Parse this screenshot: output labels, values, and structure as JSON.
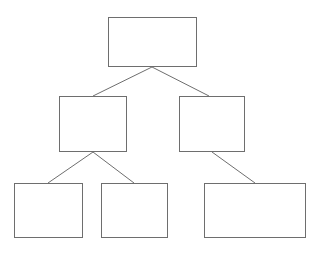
{
  "diagram": {
    "type": "tree",
    "canvas": {
      "width": 321,
      "height": 255,
      "background": "#ffffff"
    },
    "style": {
      "box_fill": "#ffffff",
      "box_border_color": "#6e6e6e",
      "box_border_width": 1,
      "connector_color": "#6e6e6e",
      "connector_width": 1
    },
    "levels": 3,
    "nodes": [
      {
        "id": "root",
        "label": "",
        "level": 0,
        "x": 108,
        "y": 17,
        "width": 89,
        "height": 50
      },
      {
        "id": "mid-left",
        "label": "",
        "level": 1,
        "x": 59,
        "y": 96,
        "width": 68,
        "height": 56
      },
      {
        "id": "mid-right",
        "label": "",
        "level": 1,
        "x": 179,
        "y": 96,
        "width": 66,
        "height": 56
      },
      {
        "id": "leaf-1",
        "label": "",
        "level": 2,
        "x": 14,
        "y": 183,
        "width": 69,
        "height": 55
      },
      {
        "id": "leaf-2",
        "label": "",
        "level": 2,
        "x": 101,
        "y": 183,
        "width": 67,
        "height": 55
      },
      {
        "id": "leaf-3",
        "label": "",
        "level": 2,
        "x": 204,
        "y": 183,
        "width": 102,
        "height": 55
      }
    ],
    "connectors": [
      {
        "id": "root-to-mid-left",
        "from": "root",
        "to": "mid-left",
        "x1": 152,
        "y1": 67,
        "x2": 93,
        "y2": 96
      },
      {
        "id": "root-to-mid-right",
        "from": "root",
        "to": "mid-right",
        "x1": 152,
        "y1": 67,
        "x2": 209,
        "y2": 96
      },
      {
        "id": "mid-left-to-leaf-1",
        "from": "mid-left",
        "to": "leaf-1",
        "x1": 93,
        "y1": 152,
        "x2": 48,
        "y2": 183
      },
      {
        "id": "mid-left-to-leaf-2",
        "from": "mid-left",
        "to": "leaf-2",
        "x1": 93,
        "y1": 152,
        "x2": 134,
        "y2": 183
      },
      {
        "id": "mid-right-to-leaf-3",
        "from": "mid-right",
        "to": "leaf-3",
        "x1": 212,
        "y1": 152,
        "x2": 255,
        "y2": 183
      }
    ]
  }
}
